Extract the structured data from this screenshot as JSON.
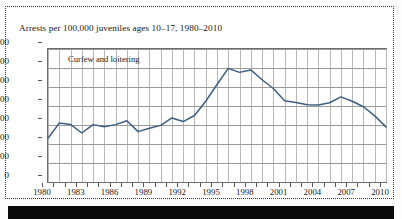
{
  "figure": {
    "title": "Arrests per 100,000 juveniles ages 10–17, 1980–2010",
    "ghost_text": "wisconsin",
    "line_color": "#3c5f82",
    "plot_border_color": "#6e6e6e",
    "grid_color": "#b9b9b9"
  },
  "chart_data": {
    "type": "line",
    "title": "Arrests per 100,000 juveniles ages 10–17, 1980–2010",
    "xlabel": "",
    "ylabel": "",
    "ylim": [
      0,
      700
    ],
    "xlim": [
      1980,
      2010
    ],
    "ytick_step": 100,
    "xtick_step": 3,
    "grid": true,
    "legend_position": "inside-top-left",
    "yticks": [
      0,
      100,
      200,
      300,
      400,
      500,
      600,
      700
    ],
    "ytick_labels": [
      "0",
      "100",
      "200",
      "300",
      "400",
      "500",
      "600",
      "700"
    ],
    "xticks": [
      1980,
      1983,
      1986,
      1989,
      1992,
      1995,
      1998,
      2001,
      2004,
      2007,
      2010
    ],
    "xtick_labels": [
      "1980",
      "1983",
      "1986",
      "1989",
      "1992",
      "1995",
      "1998",
      "2001",
      "2004",
      "2007",
      "2010"
    ],
    "annotations": [
      "Curfew and loitering"
    ],
    "series": [
      {
        "name": "Curfew and loitering",
        "x": [
          1980,
          1981,
          1982,
          1983,
          1984,
          1985,
          1986,
          1987,
          1988,
          1989,
          1990,
          1991,
          1992,
          1993,
          1994,
          1995,
          1996,
          1997,
          1998,
          1999,
          2000,
          2001,
          2002,
          2003,
          2004,
          2005,
          2006,
          2007,
          2008,
          2009,
          2010
        ],
        "values": [
          230,
          310,
          303,
          258,
          302,
          291,
          302,
          322,
          265,
          283,
          298,
          337,
          318,
          350,
          425,
          513,
          598,
          577,
          590,
          538,
          492,
          428,
          418,
          406,
          405,
          417,
          448,
          425,
          396,
          348,
          290
        ]
      }
    ]
  }
}
